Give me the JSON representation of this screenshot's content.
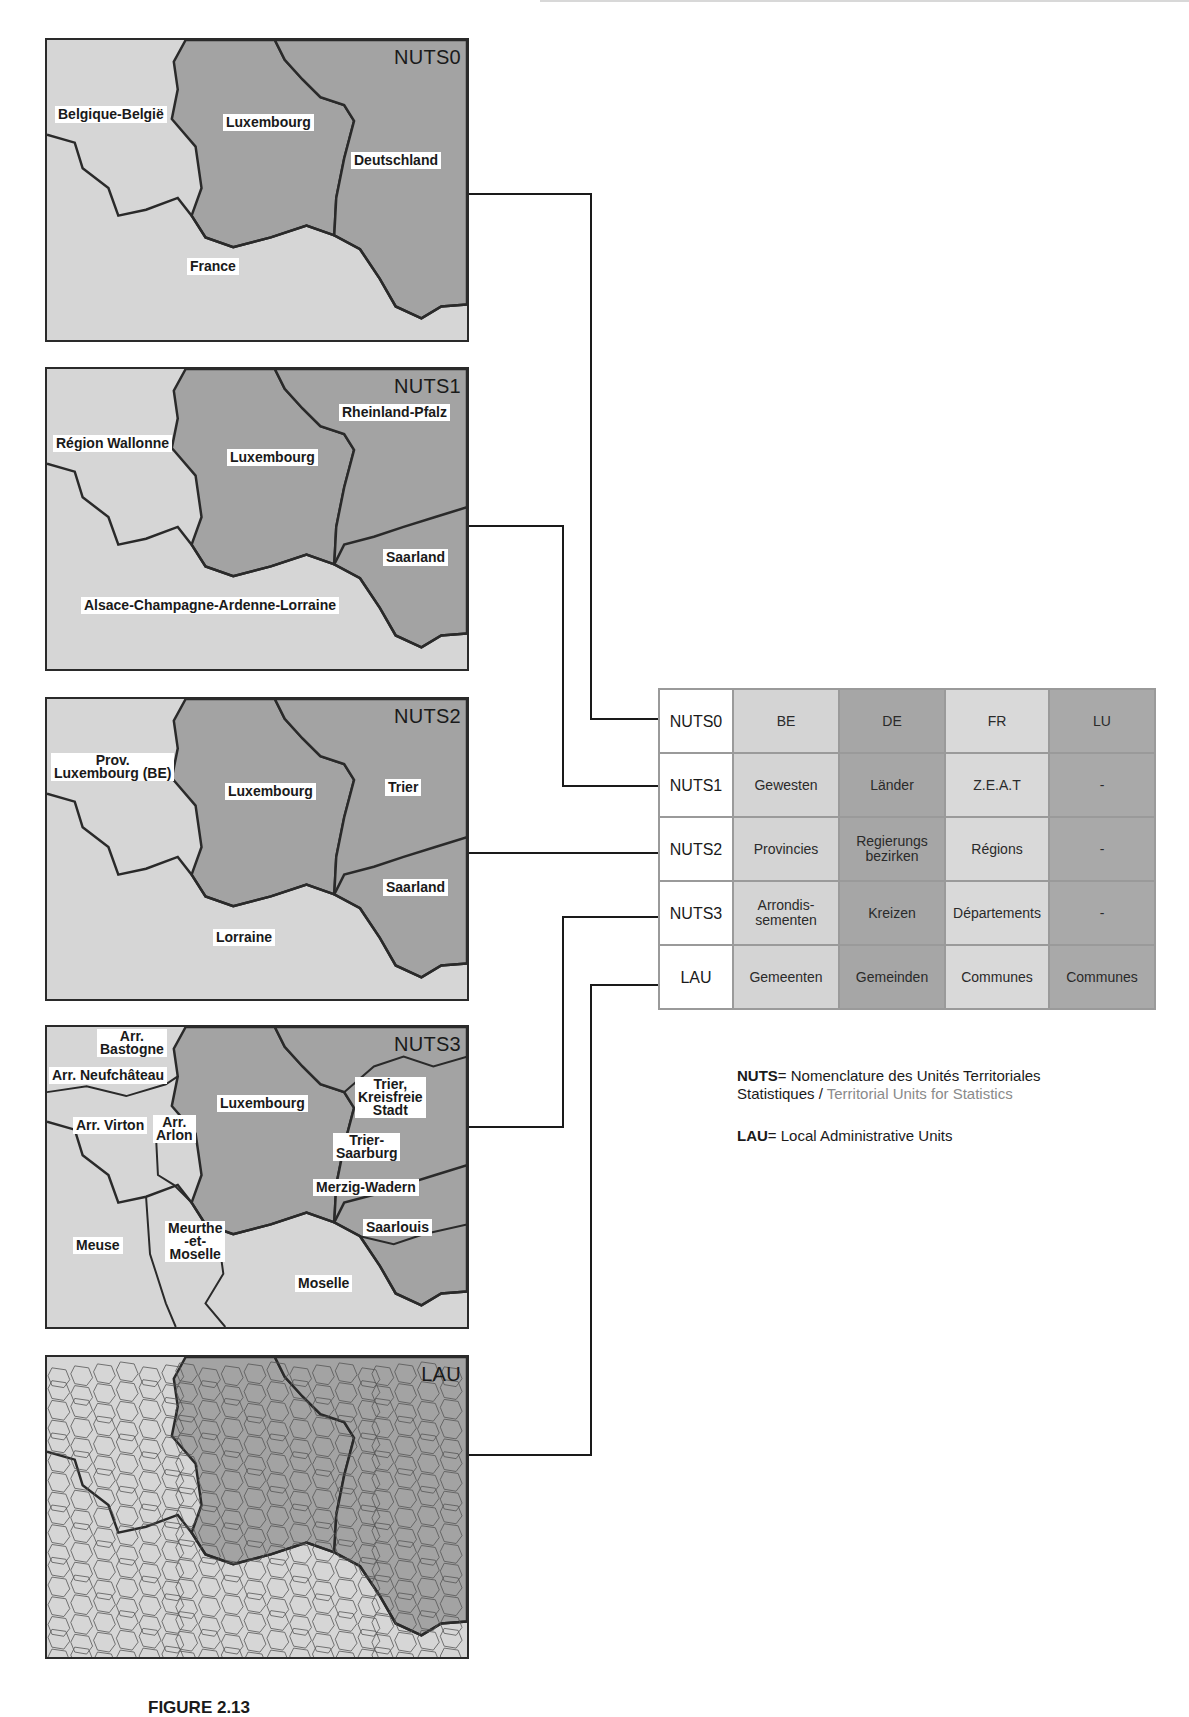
{
  "maps": [
    {
      "level": "NUTS0",
      "labels": [
        {
          "text": "Belgique-België",
          "x": 8,
          "y": 66
        },
        {
          "text": "Luxembourg",
          "x": 176,
          "y": 74
        },
        {
          "text": "Deutschland",
          "x": 304,
          "y": 112
        },
        {
          "text": "France",
          "x": 140,
          "y": 218
        }
      ]
    },
    {
      "level": "NUTS1",
      "labels": [
        {
          "text": "Rheinland-Pfalz",
          "x": 292,
          "y": 35
        },
        {
          "text": "Région Wallonne",
          "x": 6,
          "y": 66
        },
        {
          "text": "Luxembourg",
          "x": 180,
          "y": 80
        },
        {
          "text": "Saarland",
          "x": 336,
          "y": 180
        },
        {
          "text": "Alsace-Champagne-Ardenne-Lorraine",
          "x": 34,
          "y": 228
        }
      ]
    },
    {
      "level": "NUTS2",
      "labels": [
        {
          "text": "Prov.\nLuxembourg (BE)",
          "x": 4,
          "y": 54
        },
        {
          "text": "Luxembourg",
          "x": 178,
          "y": 84
        },
        {
          "text": "Trier",
          "x": 338,
          "y": 80
        },
        {
          "text": "Saarland",
          "x": 336,
          "y": 180
        },
        {
          "text": "Lorraine",
          "x": 166,
          "y": 230
        }
      ]
    },
    {
      "level": "NUTS3",
      "labels": [
        {
          "text": "Arr.\nBastogne",
          "x": 50,
          "y": 2
        },
        {
          "text": "Arr. Neufchâteau",
          "x": 2,
          "y": 40
        },
        {
          "text": "Luxembourg",
          "x": 170,
          "y": 68
        },
        {
          "text": "Trier,\nKreisfreie\nStadt",
          "x": 308,
          "y": 50
        },
        {
          "text": "Arr. Virton",
          "x": 26,
          "y": 90
        },
        {
          "text": "Arr.\nArlon",
          "x": 106,
          "y": 88
        },
        {
          "text": "Trier-\nSaarburg",
          "x": 286,
          "y": 106
        },
        {
          "text": "Merzig-Wadern",
          "x": 266,
          "y": 152
        },
        {
          "text": "Saarlouis",
          "x": 316,
          "y": 192
        },
        {
          "text": "Meurthe\n-et-\nMoselle",
          "x": 118,
          "y": 194
        },
        {
          "text": "Meuse",
          "x": 26,
          "y": 210
        },
        {
          "text": "Moselle",
          "x": 248,
          "y": 248
        }
      ]
    },
    {
      "level": "LAU",
      "labels": []
    }
  ],
  "table": {
    "header": {
      "level": "NUTS0",
      "countries": [
        "BE",
        "DE",
        "FR",
        "LU"
      ]
    },
    "rows": [
      {
        "level": "NUTS1",
        "BE": "Gewesten",
        "DE": "Länder",
        "FR": "Z.E.A.T",
        "LU": "-"
      },
      {
        "level": "NUTS2",
        "BE": "Provincies",
        "DE": "Regierungs\nbezirken",
        "FR": "Régions",
        "LU": "-"
      },
      {
        "level": "NUTS3",
        "BE": "Arrondis-\nsementen",
        "DE": "Kreizen",
        "FR": "Départements",
        "LU": "-"
      },
      {
        "level": "LAU",
        "BE": "Gemeenten",
        "DE": "Gemeinden",
        "FR": "Communes",
        "LU": "Communes"
      }
    ]
  },
  "legend": {
    "nuts_abbr": "NUTS",
    "nuts_eq": "= Nomenclature des Unités Territoriales",
    "nuts_fr2": "Statistiques / ",
    "nuts_en": "Territorial Units for Statistics",
    "lau_abbr": "LAU",
    "lau_eq": "= Local Administrative Units"
  },
  "caption": "FIGURE 2.13"
}
